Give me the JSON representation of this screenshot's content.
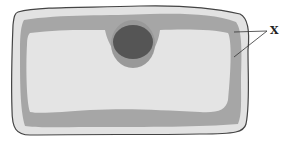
{
  "diagram": {
    "type": "plant-cell",
    "labels": [
      {
        "id": "x",
        "text": "X",
        "points_to": [
          "cytoplasm-top-right",
          "cytoplasm-right"
        ]
      }
    ],
    "parts": [
      "cell-wall",
      "cytoplasm",
      "nucleus",
      "vacuole"
    ],
    "colors": {
      "outline": "#444444",
      "cell_wall": "#e2e2e2",
      "cytoplasm": "#a6a6a6",
      "vacuole": "#e4e4e4",
      "nucleus": "#555555",
      "nucleus_halo": "#999999"
    }
  }
}
